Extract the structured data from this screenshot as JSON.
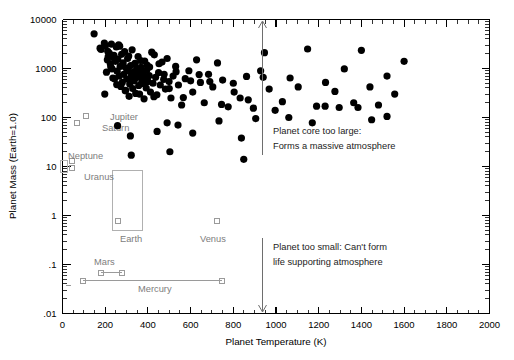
{
  "chart_data": {
    "type": "scatter",
    "title": "",
    "xlabel": "Planet Temperature (K)",
    "ylabel": "Planet Mass (Earth=1.0)",
    "xlim": [
      0,
      2000
    ],
    "ylim": [
      0.01,
      10000
    ],
    "yscale": "log",
    "xscale": "linear",
    "grid": false,
    "legend": "none",
    "xticks": [
      0,
      200,
      400,
      600,
      800,
      1000,
      1200,
      1400,
      1600,
      1800,
      2000
    ],
    "xticklabels": [
      "0",
      "200",
      "400",
      "600",
      "800",
      "1000",
      "1200",
      "1400",
      "1600",
      "1800",
      "2000"
    ],
    "yticks": [
      0.01,
      0.1,
      1,
      10,
      100,
      1000,
      10000
    ],
    "yticklabels": [
      ".01",
      ".1",
      "1",
      "10",
      "100",
      "1000",
      "10000"
    ],
    "xminor_step": 50,
    "series": [
      {
        "name": "exoplanets",
        "marker": "filled-circle",
        "color": "#000000",
        "points": [
          [
            148,
            5100
          ],
          [
            176,
            2600
          ],
          [
            181,
            2450
          ],
          [
            196,
            3300
          ],
          [
            201,
            2900
          ],
          [
            210,
            1500
          ],
          [
            214,
            1750
          ],
          [
            219,
            2050
          ],
          [
            224,
            1250
          ],
          [
            229,
            3150
          ],
          [
            232,
            980
          ],
          [
            236,
            640
          ],
          [
            241,
            1850
          ],
          [
            244,
            620
          ],
          [
            248,
            1400
          ],
          [
            252,
            2750
          ],
          [
            256,
            880
          ],
          [
            259,
            1550
          ],
          [
            263,
            3050
          ],
          [
            266,
            700
          ],
          [
            270,
            1100
          ],
          [
            273,
            430
          ],
          [
            277,
            1950
          ],
          [
            280,
            520
          ],
          [
            284,
            1300
          ],
          [
            287,
            760
          ],
          [
            291,
            2200
          ],
          [
            294,
            350
          ],
          [
            298,
            1020
          ],
          [
            301,
            610
          ],
          [
            305,
            1600
          ],
          [
            308,
            900
          ],
          [
            312,
            270
          ],
          [
            315,
            480
          ],
          [
            319,
            1150
          ],
          [
            322,
            700
          ],
          [
            326,
            2400
          ],
          [
            329,
            390
          ],
          [
            333,
            840
          ],
          [
            336,
            560
          ],
          [
            340,
            1280
          ],
          [
            343,
            310
          ],
          [
            347,
            960
          ],
          [
            350,
            660
          ],
          [
            354,
            1750
          ],
          [
            357,
            450
          ],
          [
            361,
            300
          ],
          [
            364,
            790
          ],
          [
            368,
            1050
          ],
          [
            371,
            520
          ],
          [
            375,
            620
          ],
          [
            378,
            880
          ],
          [
            382,
            240
          ],
          [
            385,
            1420
          ],
          [
            389,
            680
          ],
          [
            392,
            400
          ],
          [
            396,
            1180
          ],
          [
            400,
            545
          ],
          [
            406,
            720
          ],
          [
            412,
            330
          ],
          [
            418,
            2150
          ],
          [
            424,
            500
          ],
          [
            430,
            1900
          ],
          [
            436,
            660
          ],
          [
            442,
            290
          ],
          [
            450,
            820
          ],
          [
            458,
            460
          ],
          [
            466,
            1350
          ],
          [
            474,
            600
          ],
          [
            482,
            380
          ],
          [
            490,
            1600
          ],
          [
            499,
            540
          ],
          [
            508,
            250
          ],
          [
            518,
            700
          ],
          [
            530,
            1100
          ],
          [
            543,
            460
          ],
          [
            558,
            180
          ],
          [
            575,
            620
          ],
          [
            592,
            900
          ],
          [
            610,
            330
          ],
          [
            628,
            1500
          ],
          [
            646,
            520
          ],
          [
            664,
            200
          ],
          [
            684,
            760
          ],
          [
            704,
            420
          ],
          [
            726,
            1300
          ],
          [
            750,
            580
          ],
          [
            776,
            165
          ],
          [
            804,
            330
          ],
          [
            832,
            250
          ],
          [
            862,
            690
          ],
          [
            894,
            155
          ],
          [
            928,
            900
          ],
          [
            946,
            2100
          ],
          [
            968,
            380
          ],
          [
            996,
            140
          ],
          [
            1030,
            210
          ],
          [
            1066,
            640
          ],
          [
            1104,
            420
          ],
          [
            1148,
            2500
          ],
          [
            1190,
            170
          ],
          [
            1232,
            520
          ],
          [
            1276,
            340
          ],
          [
            1320,
            980
          ],
          [
            1364,
            200
          ],
          [
            1400,
            2350
          ],
          [
            1440,
            420
          ],
          [
            1480,
            180
          ],
          [
            1520,
            700
          ],
          [
            1556,
            300
          ],
          [
            1600,
            1400
          ],
          [
            322,
            17
          ],
          [
            503,
            20
          ],
          [
            849,
            14
          ],
          [
            258,
            68
          ],
          [
            318,
            42
          ],
          [
            443,
            52
          ],
          [
            490,
            78
          ],
          [
            541,
            70
          ],
          [
            610,
            48
          ],
          [
            733,
            85
          ],
          [
            838,
            38
          ],
          [
            905,
            95
          ],
          [
            1060,
            100
          ],
          [
            1170,
            78
          ],
          [
            1230,
            170
          ],
          [
            1296,
            160
          ],
          [
            1384,
            160
          ],
          [
            1448,
            90
          ],
          [
            1520,
            105
          ],
          [
            198,
            300
          ],
          [
            206,
            840
          ],
          [
            212,
            2250
          ],
          [
            226,
            1080
          ],
          [
            238,
            1680
          ],
          [
            254,
            470
          ],
          [
            268,
            2850
          ],
          [
            282,
            1150
          ],
          [
            296,
            360
          ],
          [
            310,
            1800
          ],
          [
            324,
            590
          ],
          [
            338,
            1230
          ],
          [
            352,
            760
          ],
          [
            366,
            1450
          ],
          [
            380,
            495
          ],
          [
            394,
            920
          ],
          [
            408,
            1070
          ],
          [
            428,
            265
          ],
          [
            452,
            1250
          ],
          [
            476,
            760
          ],
          [
            500,
            390
          ],
          [
            532,
            860
          ],
          [
            566,
            255
          ],
          [
            600,
            560
          ],
          [
            640,
            750
          ],
          [
            690,
            540
          ],
          [
            745,
            185
          ],
          [
            800,
            500
          ],
          [
            870,
            230
          ],
          [
            940,
            660
          ]
        ]
      }
    ],
    "solar_system": [
      {
        "name": "Jupiter",
        "temp": 125,
        "mass": 318,
        "label_x": 113,
        "label_y": 117,
        "marker_x": 78,
        "marker_y": 123
      },
      {
        "name": "Saturn",
        "temp": 95,
        "mass": 95,
        "label_x": 113,
        "label_y": 126,
        "marker_x": 78,
        "marker_y": 123
      },
      {
        "name": "Neptune",
        "temp": 60,
        "mass": 17,
        "label_x": 70,
        "label_y": 155,
        "marker_x": 72,
        "marker_y": 166
      },
      {
        "name": "Uranus",
        "temp": 58,
        "mass": 14.5,
        "label_x": 88,
        "label_y": 178,
        "marker_x": 72,
        "marker_y": 170
      },
      {
        "name": "Earth",
        "temp": 288,
        "mass": 1.0,
        "label_x": 125,
        "label_y": 240,
        "marker_x": 119,
        "marker_y": 221
      },
      {
        "name": "Venus",
        "temp": 730,
        "mass": 0.82,
        "label_x": 200,
        "label_y": 240,
        "marker_x": 217,
        "marker_y": 222
      },
      {
        "name": "Mars",
        "temp": 230,
        "mass": 0.107,
        "label_x": 92,
        "label_y": 262,
        "marker_x": 101,
        "marker_y": 272
      },
      {
        "name": "Mercury",
        "temp": 400,
        "mass": 0.055,
        "label_x": 140,
        "label_y": 287,
        "marker_x": 83,
        "marker_y": 280
      }
    ],
    "annotations": [
      {
        "id": "core-too-large",
        "lines": [
          "Planet core too large:",
          "Forms a massive atmosphere"
        ]
      },
      {
        "id": "too-small",
        "lines": [
          "Planet too small: Can't form",
          "life supporting atmosphere"
        ]
      }
    ]
  }
}
